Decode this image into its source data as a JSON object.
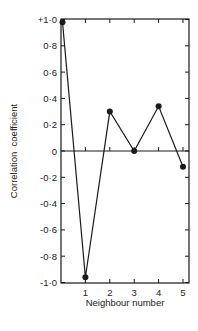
{
  "chart_data": {
    "type": "line",
    "title": "",
    "xlabel": "Neighbour number",
    "ylabel": "Correlation  coefficient",
    "x": [
      0,
      1,
      2,
      3,
      4,
      5
    ],
    "series": [
      {
        "name": "Correlation coefficient",
        "values": [
          0.98,
          -0.96,
          0.3,
          0.0,
          0.34,
          -0.12
        ]
      }
    ],
    "xlim": [
      0,
      5.3
    ],
    "ylim": [
      -1.0,
      1.0
    ],
    "x_ticks": [
      1,
      2,
      3,
      4,
      5
    ],
    "x_tick_labels": [
      "1",
      "2",
      "3",
      "4",
      "5"
    ],
    "y_ticks": [
      1.0,
      0.8,
      0.6,
      0.4,
      0.2,
      0,
      -0.2,
      -0.4,
      -0.6,
      -0.8,
      -1.0
    ],
    "y_tick_labels": [
      "+1·0",
      "0·8",
      "0·6",
      "0·4",
      "0·2",
      "0",
      "-0·2",
      "-0·4",
      "-0·6",
      "-0·8",
      "-1·0"
    ],
    "zero_line": true,
    "grid": false,
    "legend": null,
    "marker": "filled-circle"
  },
  "colors": {
    "line": "#1a1a1a",
    "axis": "#1a1a1a",
    "background": "#ffffff"
  }
}
